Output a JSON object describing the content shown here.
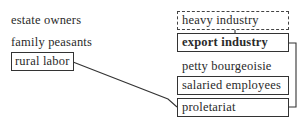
{
  "left_column": {
    "items": [
      {
        "label": "estate owners",
        "style": "plain"
      },
      {
        "label": "family peasants",
        "style": "plain"
      },
      {
        "label": "rural labor",
        "style": "boxed"
      }
    ]
  },
  "right_column": {
    "items": [
      {
        "label": "heavy industry",
        "style": "dashed"
      },
      {
        "label": "export industry",
        "style": "boxed-bold"
      },
      {
        "label": "petty bourgeoisie",
        "style": "plain"
      },
      {
        "label": "salaried employees",
        "style": "boxed"
      },
      {
        "label": "proletariat",
        "style": "boxed"
      }
    ]
  },
  "connections": [
    {
      "from": "heavy industry",
      "to": "export industry",
      "type": "vertical-tick"
    },
    {
      "from": "export industry",
      "to": "proletariat",
      "type": "right-bracket"
    },
    {
      "from": "rural labor",
      "to": "proletariat",
      "type": "diagonal"
    }
  ],
  "colors": {
    "line": "#333333",
    "text": "#2a2a2a",
    "background": "#ffffff"
  }
}
